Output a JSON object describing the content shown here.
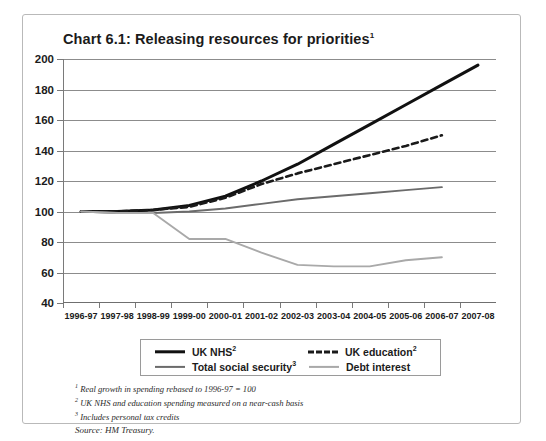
{
  "title": {
    "text": "Chart 6.1: Releasing resources for priorities",
    "superscript": "1"
  },
  "legend": [
    {
      "label": "UK NHS",
      "superscript": "2",
      "style": "solid-thick",
      "color": "#111111"
    },
    {
      "label": "UK education",
      "superscript": "2",
      "style": "dashed",
      "color": "#1a1a1a"
    },
    {
      "label": "Total social security",
      "superscript": "3",
      "style": "solid",
      "color": "#6b6b6b"
    },
    {
      "label": "Debt interest",
      "superscript": "",
      "style": "solid",
      "color": "#a9a9a9"
    }
  ],
  "notes": [
    {
      "superscript": "1",
      "text": "Real growth in spending rebased to 1996-97 = 100"
    },
    {
      "superscript": "2",
      "text": "UK NHS and education spending measured on a near-cash basis"
    },
    {
      "superscript": "3",
      "text": "Includes personal tax credits"
    }
  ],
  "source": "Source: HM Treasury.",
  "chart_data": {
    "type": "line",
    "title": "Chart 6.1: Releasing resources for priorities",
    "xlabel": "",
    "ylabel": "",
    "ylim": [
      40,
      200
    ],
    "yticks": [
      40,
      60,
      80,
      100,
      120,
      140,
      160,
      180,
      200
    ],
    "grid": true,
    "legend_position": "bottom",
    "categories": [
      "1996-97",
      "1997-98",
      "1998-99",
      "1999-00",
      "2000-01",
      "2001-02",
      "2002-03",
      "2003-04",
      "2004-05",
      "2005-06",
      "2006-07",
      "2007-08"
    ],
    "series": [
      {
        "name": "UK NHS",
        "color": "#111111",
        "style": "solid-thick",
        "values": [
          100,
          100,
          101,
          104,
          110,
          120,
          131,
          144,
          157,
          170,
          183,
          196
        ]
      },
      {
        "name": "UK education",
        "color": "#1a1a1a",
        "style": "dashed",
        "values": [
          100,
          100,
          101,
          103,
          109,
          118,
          125,
          131,
          137,
          143,
          150,
          null
        ]
      },
      {
        "name": "Total social security",
        "color": "#6b6b6b",
        "style": "solid",
        "values": [
          100,
          99,
          99,
          100,
          102,
          105,
          108,
          110,
          112,
          114,
          116,
          null
        ]
      },
      {
        "name": "Debt interest",
        "color": "#a9a9a9",
        "style": "solid",
        "values": [
          100,
          99,
          99,
          82,
          82,
          73,
          65,
          64,
          64,
          68,
          70,
          null
        ]
      }
    ]
  }
}
